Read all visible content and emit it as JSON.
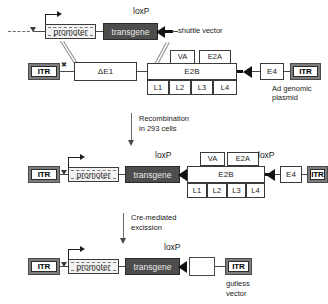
{
  "figure": {
    "type": "molecular-biology-schematic"
  },
  "colors": {
    "transgene_fill": "#4d4d4d",
    "itr_frame": "#7d7d7d",
    "promoter_fill": "#f2f2f2",
    "line": "#4a4a4a",
    "loxp": "#121212",
    "text": "#1a1a1a"
  },
  "row1": {
    "name": "shuttle-vector-and-ad-genomic-plasmid",
    "shuttle": {
      "promoter": "promoter",
      "transgene": "transgene",
      "loxp_label": "loxP",
      "caption": "shuttle vector",
      "psi_icon": "psi-packaging-signal-icon",
      "transcription_arrow_icon": "transcription-start-arrow-icon",
      "dashed_left_icon": "dashed-plasmid-backbone-icon"
    },
    "genome": {
      "itr_left": "ITR",
      "deleted_e1": "ΔE1",
      "e2b": "E2B",
      "va": "VA",
      "e2a": "E2A",
      "late": [
        "L1",
        "L2",
        "L3",
        "L4"
      ],
      "e4": "E4",
      "itr_right": "ITR",
      "caption_line1": "Ad genomic",
      "caption_line2": "plasmid",
      "crossover_icon": "homologous-recombination-crossover-icon"
    }
  },
  "step1": {
    "name": "recombination-step",
    "line1": "Recombination",
    "line2": "in 293 cells",
    "arrow_icon": "down-arrow-icon"
  },
  "row2": {
    "name": "recombinant-adenovirus",
    "itr_left": "ITR",
    "psi_icon": "psi-packaging-signal-icon",
    "promoter": "promoter",
    "transgene": "transgene",
    "loxp_left_label": "loxP",
    "va": "VA",
    "e2a": "E2A",
    "e2b": "E2B",
    "late": [
      "L1",
      "L2",
      "L3",
      "L4"
    ],
    "loxp_right_label": "loxP",
    "e4": "E4",
    "itr_right": "ITR"
  },
  "step2": {
    "name": "cre-excision-step",
    "line1": "Cre-mediated",
    "line2": "excission",
    "arrow_icon": "down-arrow-icon"
  },
  "row3": {
    "name": "gutless-vector",
    "itr_left": "ITR",
    "psi_icon": "psi-packaging-signal-icon",
    "promoter": "promoter",
    "transgene": "transgene",
    "loxp_label": "loxP",
    "stuffer": "",
    "itr_right": "ITR",
    "caption_line1": "gutless",
    "caption_line2": "vector"
  }
}
